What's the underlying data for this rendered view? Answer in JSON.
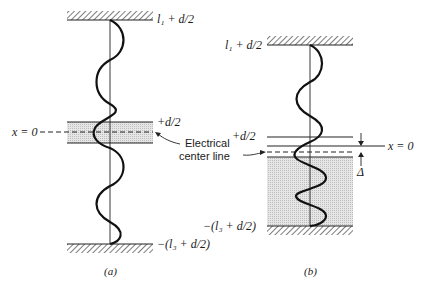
{
  "figure": {
    "panel_a": {
      "caption": "(a)",
      "top_label": "l₁ + d/2",
      "plus_label": "+d/2",
      "origin_label": "x = 0",
      "bottom_label": "−(l₃ + d/2)"
    },
    "panel_b": {
      "caption": "(b)",
      "top_label": "l₁ + d/2",
      "plus_label": "+d/2",
      "origin_label": "x = 0",
      "delta_label": "Δ",
      "bottom_label": "−(l₃ + d/2)"
    },
    "annotation": {
      "line1": "Electrical",
      "line2": "center line"
    }
  }
}
